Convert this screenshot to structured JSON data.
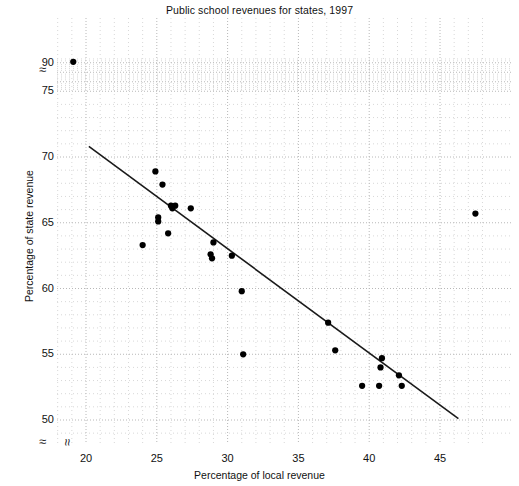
{
  "chart_data": {
    "type": "scatter",
    "title": "Public school revenues for states, 1997",
    "xlabel": "Percentage of local revenue",
    "ylabel": "Percentage of state revenue",
    "xlim": [
      17.5,
      48.5
    ],
    "ylim": [
      48.5,
      92.5
    ],
    "xticks": [
      20,
      25,
      30,
      35,
      40,
      45
    ],
    "yticks": [
      50,
      55,
      60,
      65,
      70,
      75,
      90
    ],
    "grid": true,
    "grid_style": "dotted",
    "legend": null,
    "axis_breaks": {
      "y_between": [
        75,
        90
      ],
      "y_below": 50,
      "x_below": 20,
      "glyph": "≈"
    },
    "marker": {
      "shape": "circle",
      "color": "#000000",
      "size": 5
    },
    "points": [
      {
        "x": 19.1,
        "y": 90.5
      },
      {
        "x": 24.0,
        "y": 63.3
      },
      {
        "x": 24.9,
        "y": 68.9
      },
      {
        "x": 25.1,
        "y": 65.4
      },
      {
        "x": 25.1,
        "y": 65.1
      },
      {
        "x": 25.4,
        "y": 67.9
      },
      {
        "x": 25.8,
        "y": 64.2
      },
      {
        "x": 26.0,
        "y": 66.3
      },
      {
        "x": 26.1,
        "y": 66.1
      },
      {
        "x": 26.3,
        "y": 66.3
      },
      {
        "x": 27.4,
        "y": 66.1
      },
      {
        "x": 29.0,
        "y": 63.5
      },
      {
        "x": 28.8,
        "y": 62.6
      },
      {
        "x": 28.9,
        "y": 62.3
      },
      {
        "x": 30.3,
        "y": 62.5
      },
      {
        "x": 31.0,
        "y": 59.8
      },
      {
        "x": 31.1,
        "y": 55.0
      },
      {
        "x": 37.1,
        "y": 57.4
      },
      {
        "x": 37.6,
        "y": 55.3
      },
      {
        "x": 39.5,
        "y": 52.6
      },
      {
        "x": 40.9,
        "y": 54.7
      },
      {
        "x": 40.8,
        "y": 54.0
      },
      {
        "x": 40.7,
        "y": 52.6
      },
      {
        "x": 42.1,
        "y": 53.4
      },
      {
        "x": 42.3,
        "y": 52.6
      },
      {
        "x": 47.5,
        "y": 65.7
      }
    ],
    "trendline": {
      "type": "linear",
      "x_start": 20.2,
      "y_start": 70.8,
      "x_end": 46.3,
      "y_end": 50.1,
      "color": "#1a1a1a"
    }
  }
}
